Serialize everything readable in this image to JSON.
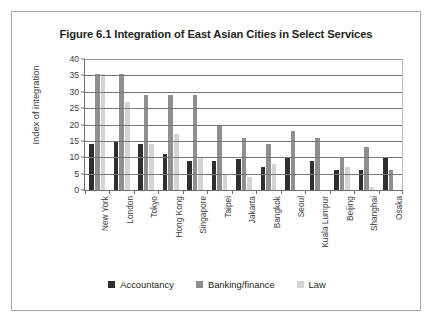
{
  "figure": {
    "title": "Figure 6.1 Integration of East Asian Cities in Select Services"
  },
  "legend": {
    "items": [
      {
        "label": "Accountancy",
        "color": "#2f2f33"
      },
      {
        "label": "Banking/finance",
        "color": "#8e8e93"
      },
      {
        "label": "Law",
        "color": "#d4d4d6"
      }
    ]
  },
  "chart_data": {
    "type": "bar",
    "title": "Figure 6.1 Integration of East Asian Cities in Select Services",
    "xlabel": "",
    "ylabel": "Index of integration",
    "ylim": [
      0,
      40
    ],
    "yticks": [
      0,
      5,
      10,
      15,
      20,
      25,
      30,
      35,
      40
    ],
    "grid": true,
    "legend_position": "bottom",
    "categories": [
      "New York",
      "London",
      "Tokyo",
      "Hong Kong",
      "Singapore",
      "Taipei",
      "Jakarta",
      "Bangkok",
      "Seoul",
      "Kuala Lumpur",
      "Beijing",
      "Shanghai",
      "Osaka"
    ],
    "series": [
      {
        "name": "Accountancy",
        "color": "#2f2f33",
        "values": [
          14,
          15,
          14,
          11,
          9,
          9,
          9.5,
          7,
          10,
          9,
          6,
          6,
          10
        ]
      },
      {
        "name": "Banking/finance",
        "color": "#8e8e93",
        "values": [
          35.5,
          35.5,
          29,
          29,
          29,
          20,
          16,
          14,
          18,
          16,
          10,
          13,
          6
        ]
      },
      {
        "name": "Law",
        "color": "#d4d4d6",
        "values": [
          35.5,
          27,
          14,
          17,
          10,
          5,
          4,
          8,
          0,
          0,
          7,
          1,
          0
        ]
      }
    ]
  }
}
